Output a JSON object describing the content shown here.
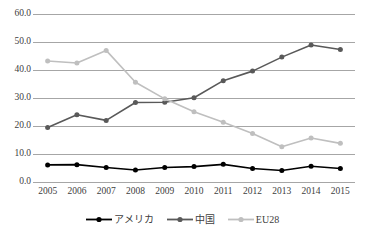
{
  "chart_data": {
    "type": "line",
    "title": "",
    "xlabel": "",
    "ylabel": "",
    "ylim": [
      0,
      60
    ],
    "ytick_labels": [
      "0.0",
      "10.0",
      "20.0",
      "30.0",
      "40.0",
      "50.0",
      "60.0"
    ],
    "ytick_values": [
      0,
      10,
      20,
      30,
      40,
      50,
      60
    ],
    "grid": true,
    "legend_position": "bottom",
    "categories": [
      "2005",
      "2006",
      "2007",
      "2008",
      "2009",
      "2010",
      "2011",
      "2012",
      "2013",
      "2014",
      "2015"
    ],
    "x": [
      2005,
      2006,
      2007,
      2008,
      2009,
      2010,
      2011,
      2012,
      2013,
      2014,
      2015
    ],
    "series": [
      {
        "name": "アメリカ",
        "color": "#000000",
        "marker": "circle",
        "values": [
          6.1,
          6.2,
          5.2,
          4.3,
          5.2,
          5.5,
          6.3,
          4.8,
          4.1,
          5.6,
          4.8
        ]
      },
      {
        "name": "中国",
        "color": "#595959",
        "marker": "circle",
        "values": [
          19.5,
          24.0,
          22.0,
          28.4,
          28.5,
          30.1,
          36.2,
          39.6,
          44.6,
          48.9,
          47.3
        ]
      },
      {
        "name": "EU28",
        "color": "#bfbfbf",
        "marker": "circle",
        "values": [
          43.2,
          42.5,
          47.0,
          35.6,
          29.7,
          25.1,
          21.3,
          17.3,
          12.6,
          15.7,
          13.8
        ]
      }
    ]
  },
  "legend": {
    "items": [
      {
        "label": "アメリカ",
        "color": "#000000"
      },
      {
        "label": "中国",
        "color": "#595959"
      },
      {
        "label": "EU28",
        "color": "#bfbfbf"
      }
    ]
  },
  "axes": {
    "gridline_color": "#a6a6a6",
    "tick_label_color": "#404040"
  }
}
